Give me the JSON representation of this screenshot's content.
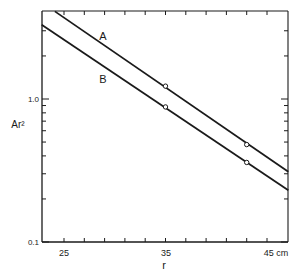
{
  "chart_data": {
    "type": "line",
    "title": "",
    "xlabel": "r",
    "ylabel": "Ar²",
    "x_unit": "cm",
    "xscale": "linear",
    "yscale": "log",
    "xlim": [
      22.8,
      47.1
    ],
    "ylim": [
      0.1,
      4.1
    ],
    "grid": false,
    "legend": "inline labels",
    "x_tick_labels": [
      "25",
      "35",
      "45 cm"
    ],
    "x_ticks": [
      25,
      27,
      29,
      31,
      33,
      35,
      37,
      39,
      41,
      43,
      45
    ],
    "y_tick_labels": [
      "0.1",
      "1.0"
    ],
    "y_major_ticks": [
      0.1,
      1.0
    ],
    "y_minor_ticks": [
      0.2,
      0.3,
      0.4,
      0.5,
      0.6,
      0.7,
      0.8,
      0.9,
      2,
      3
    ],
    "series": [
      {
        "name": "A",
        "line": [
          [
            24.1,
            4.1
          ],
          [
            47.1,
            0.31
          ]
        ],
        "points": [
          [
            35,
            1.23
          ],
          [
            43,
            0.48
          ]
        ],
        "marker": "open-circle"
      },
      {
        "name": "B",
        "line": [
          [
            22.8,
            3.3
          ],
          [
            47.1,
            0.23
          ]
        ],
        "points": [
          [
            35,
            0.88
          ],
          [
            43,
            0.36
          ]
        ],
        "marker": "open-circle"
      }
    ]
  }
}
